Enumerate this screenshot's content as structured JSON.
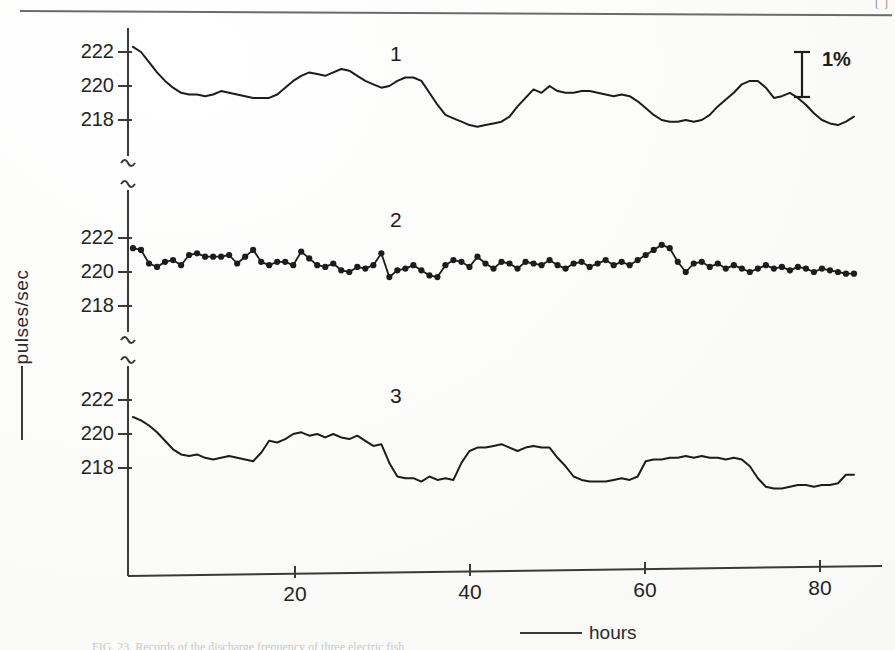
{
  "page": {
    "page_number": "[ ]",
    "caption": "FIG. 23. Records of the discharge frequency of three electric fish"
  },
  "axes": {
    "ylabel": "pulses/sec",
    "xlabel": "hours",
    "y_ticks": [
      222,
      220,
      218
    ],
    "x_ticks": [
      20,
      40,
      60,
      80
    ],
    "scalebar_label": "1%"
  },
  "panels": [
    {
      "id": "1",
      "label": "1"
    },
    {
      "id": "2",
      "label": "2"
    },
    {
      "id": "3",
      "label": "3"
    }
  ],
  "colors": {
    "ink": "#1c1c1c",
    "axis": "#3a3a3a",
    "paper": "#fdfdfc",
    "rule": "#6b6b6b"
  },
  "chart_data": {
    "type": "line",
    "title": "",
    "xlabel": "hours",
    "ylabel": "pulses/sec",
    "xlim": [
      0,
      92
    ],
    "ylim_per_panel": [
      216.4,
      223.2
    ],
    "grid": false,
    "legend": "none",
    "annotations": [
      {
        "text": "1%",
        "kind": "scale-bar",
        "x": 86.5,
        "panel": 1
      },
      {
        "text": "1",
        "kind": "panel-id",
        "x": 40,
        "panel": 1
      },
      {
        "text": "2",
        "kind": "panel-id",
        "x": 40,
        "panel": 2
      },
      {
        "text": "3",
        "kind": "panel-id",
        "x": 40,
        "panel": 3
      }
    ],
    "series": [
      {
        "name": "1",
        "panel": 1,
        "markers": false,
        "x": [
          0,
          1,
          2,
          3,
          4,
          5,
          6,
          7,
          8,
          9,
          10,
          11,
          12,
          13,
          14,
          15,
          16,
          17,
          18,
          19,
          20,
          21,
          22,
          23,
          24,
          25,
          26,
          27,
          28,
          29,
          30,
          31,
          32,
          33,
          34,
          35,
          36,
          37,
          38,
          39,
          40,
          41,
          42,
          43,
          44,
          45,
          46,
          47,
          48,
          49,
          50,
          51,
          52,
          53,
          54,
          55,
          56,
          57,
          58,
          59,
          60,
          61,
          62,
          63,
          64,
          65,
          66,
          67,
          68,
          69,
          70,
          71,
          72,
          73,
          74,
          75,
          76,
          77,
          78,
          79,
          80,
          81,
          82,
          83,
          84,
          85,
          86,
          87,
          88,
          89,
          90
        ],
        "y": [
          222.3,
          222.0,
          221.4,
          220.8,
          220.3,
          219.9,
          219.6,
          219.5,
          219.5,
          219.4,
          219.5,
          219.7,
          219.6,
          219.5,
          219.4,
          219.3,
          219.3,
          219.3,
          219.5,
          219.9,
          220.3,
          220.6,
          220.8,
          220.7,
          220.6,
          220.8,
          221.0,
          220.9,
          220.6,
          220.3,
          220.1,
          219.9,
          220.0,
          220.3,
          220.5,
          220.5,
          220.3,
          219.6,
          218.9,
          218.3,
          218.1,
          217.9,
          217.7,
          217.6,
          217.7,
          217.8,
          217.9,
          218.2,
          218.8,
          219.3,
          219.8,
          219.6,
          220.0,
          219.7,
          219.6,
          219.6,
          219.7,
          219.7,
          219.6,
          219.5,
          219.4,
          219.5,
          219.4,
          219.1,
          218.7,
          218.3,
          218.0,
          217.9,
          217.9,
          218.0,
          217.9,
          218.0,
          218.3,
          218.8,
          219.2,
          219.6,
          220.1,
          220.3,
          220.3,
          219.9,
          219.3,
          219.4,
          219.6,
          219.3,
          218.9,
          218.4,
          218.0,
          217.8,
          217.7,
          217.9,
          218.2
        ]
      },
      {
        "name": "2",
        "panel": 2,
        "markers": true,
        "x": [
          0,
          1,
          2,
          3,
          4,
          5,
          6,
          7,
          8,
          9,
          10,
          11,
          12,
          13,
          14,
          15,
          16,
          17,
          18,
          19,
          20,
          21,
          22,
          23,
          24,
          25,
          26,
          27,
          28,
          29,
          30,
          31,
          32,
          33,
          34,
          35,
          36,
          37,
          38,
          39,
          40,
          41,
          42,
          43,
          44,
          45,
          46,
          47,
          48,
          49,
          50,
          51,
          52,
          53,
          54,
          55,
          56,
          57,
          58,
          59,
          60,
          61,
          62,
          63,
          64,
          65,
          66,
          67,
          68,
          69,
          70,
          71,
          72,
          73,
          74,
          75,
          76,
          77,
          78,
          79,
          80,
          81,
          82,
          83,
          84,
          85,
          86,
          87,
          88,
          89,
          90
        ],
        "y": [
          221.4,
          221.3,
          220.5,
          220.3,
          220.6,
          220.7,
          220.4,
          221.0,
          221.1,
          220.9,
          220.9,
          220.9,
          221.0,
          220.5,
          220.9,
          221.3,
          220.6,
          220.4,
          220.6,
          220.6,
          220.4,
          221.2,
          220.8,
          220.4,
          220.3,
          220.5,
          220.1,
          220.0,
          220.3,
          220.2,
          220.4,
          221.1,
          219.7,
          220.1,
          220.2,
          220.4,
          220.1,
          219.8,
          219.7,
          220.4,
          220.7,
          220.6,
          220.3,
          220.9,
          220.5,
          220.2,
          220.6,
          220.5,
          220.2,
          220.6,
          220.5,
          220.4,
          220.7,
          220.4,
          220.2,
          220.5,
          220.6,
          220.3,
          220.5,
          220.7,
          220.4,
          220.6,
          220.4,
          220.7,
          221.0,
          221.3,
          221.6,
          221.4,
          220.6,
          220.0,
          220.5,
          220.6,
          220.3,
          220.5,
          220.2,
          220.4,
          220.2,
          220.0,
          220.2,
          220.4,
          220.2,
          220.3,
          220.1,
          220.3,
          220.2,
          220.0,
          220.2,
          220.1,
          220.0,
          219.9,
          219.9
        ]
      },
      {
        "name": "3",
        "panel": 3,
        "markers": false,
        "x": [
          0,
          1,
          2,
          3,
          4,
          5,
          6,
          7,
          8,
          9,
          10,
          11,
          12,
          13,
          14,
          15,
          16,
          17,
          18,
          19,
          20,
          21,
          22,
          23,
          24,
          25,
          26,
          27,
          28,
          29,
          30,
          31,
          32,
          33,
          34,
          35,
          36,
          37,
          38,
          39,
          40,
          41,
          42,
          43,
          44,
          45,
          46,
          47,
          48,
          49,
          50,
          51,
          52,
          53,
          54,
          55,
          56,
          57,
          58,
          59,
          60,
          61,
          62,
          63,
          64,
          65,
          66,
          67,
          68,
          69,
          70,
          71,
          72,
          73,
          74,
          75,
          76,
          77,
          78,
          79,
          80,
          81,
          82,
          83,
          84,
          85,
          86,
          87,
          88,
          89,
          90
        ],
        "y": [
          221.0,
          220.8,
          220.5,
          220.1,
          219.6,
          219.1,
          218.8,
          218.7,
          218.8,
          218.6,
          218.5,
          218.6,
          218.7,
          218.6,
          218.5,
          218.4,
          218.9,
          219.6,
          219.5,
          219.7,
          220.0,
          220.1,
          219.9,
          220.0,
          219.8,
          220.0,
          219.8,
          219.7,
          219.9,
          219.6,
          219.3,
          219.4,
          218.3,
          217.5,
          217.4,
          217.4,
          217.2,
          217.5,
          217.3,
          217.4,
          217.3,
          218.3,
          219.0,
          219.2,
          219.2,
          219.3,
          219.4,
          219.2,
          219.0,
          219.2,
          219.3,
          219.2,
          219.2,
          218.6,
          218.1,
          217.5,
          217.3,
          217.2,
          217.2,
          217.2,
          217.3,
          217.4,
          217.3,
          217.5,
          218.4,
          218.5,
          218.5,
          218.6,
          218.6,
          218.7,
          218.6,
          218.7,
          218.6,
          218.6,
          218.5,
          218.6,
          218.5,
          218.1,
          217.4,
          216.9,
          216.8,
          216.8,
          216.9,
          217.0,
          217.0,
          216.9,
          217.0,
          217.0,
          217.1,
          217.6,
          217.6
        ]
      }
    ]
  }
}
